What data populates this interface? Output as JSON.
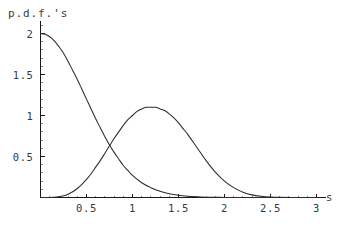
{
  "figure": {
    "width": 344,
    "height": 231,
    "background_color": "#ffffff",
    "title": "p.d.f.'s"
  },
  "style": {
    "curve_color": "#2b2b2b",
    "axis_color": "#1a1a1a",
    "minor_tick_color": "#8a8a8a",
    "text_color": "#3a3a3a"
  },
  "chart_data": {
    "type": "line",
    "title": "p.d.f.'s",
    "xlabel": "s",
    "ylabel": "",
    "xlim": [
      0,
      3.1
    ],
    "ylim": [
      0,
      2.15
    ],
    "grid": false,
    "legend": "none",
    "x_ticks": [
      0.5,
      1,
      1.5,
      2,
      2.5,
      3
    ],
    "x_tick_labels": [
      "0.5",
      "1",
      "1.5",
      "2",
      "2.5",
      "3"
    ],
    "y_ticks": [
      0.5,
      1,
      1.5,
      2
    ],
    "y_tick_labels": [
      "0.5",
      "1",
      "1.5",
      "2"
    ],
    "x_minor_tick_step": 0.1,
    "y_minor_tick_step": 0.1,
    "annotations": [
      "curves cross at approximately s = 0.74, pdf = 0.38"
    ],
    "series": [
      {
        "name": "decaying p.d.f.",
        "description": "monotonically decreasing density starting at 2.0",
        "x": [
          0.0,
          0.05,
          0.1,
          0.15,
          0.2,
          0.25,
          0.3,
          0.35,
          0.4,
          0.45,
          0.5,
          0.55,
          0.6,
          0.65,
          0.7,
          0.75,
          0.8,
          0.85,
          0.9,
          0.95,
          1.0,
          1.1,
          1.2,
          1.3,
          1.4,
          1.5,
          1.6,
          1.7,
          1.8,
          1.9,
          2.0,
          2.1,
          2.2,
          2.3,
          2.4,
          2.5,
          2.6,
          2.8,
          3.0
        ],
        "y": [
          2.0,
          1.99,
          1.96,
          1.91,
          1.84,
          1.76,
          1.66,
          1.55,
          1.44,
          1.32,
          1.2,
          1.08,
          0.96,
          0.85,
          0.74,
          0.64,
          0.55,
          0.47,
          0.39,
          0.33,
          0.27,
          0.18,
          0.12,
          0.075,
          0.046,
          0.027,
          0.015,
          0.008,
          0.004,
          0.002,
          0.001,
          0.0006,
          0.0003,
          0.0001,
          0.0001,
          5e-05,
          2e-05,
          1e-05,
          0.0
        ]
      },
      {
        "name": "bell-shaped p.d.f.",
        "description": "unimodal density peaking near s = 1.25",
        "peak_x": 1.25,
        "peak_y": 1.1,
        "x": [
          0.0,
          0.1,
          0.2,
          0.25,
          0.3,
          0.35,
          0.4,
          0.45,
          0.5,
          0.55,
          0.6,
          0.65,
          0.7,
          0.75,
          0.8,
          0.85,
          0.9,
          0.95,
          1.0,
          1.05,
          1.1,
          1.15,
          1.2,
          1.25,
          1.3,
          1.35,
          1.4,
          1.45,
          1.5,
          1.55,
          1.6,
          1.7,
          1.8,
          1.9,
          2.0,
          2.1,
          2.2,
          2.3,
          2.4,
          2.5,
          2.6,
          2.8,
          3.0
        ],
        "y": [
          0.0,
          0.0,
          0.01,
          0.02,
          0.04,
          0.07,
          0.11,
          0.16,
          0.22,
          0.29,
          0.37,
          0.45,
          0.54,
          0.63,
          0.72,
          0.8,
          0.88,
          0.95,
          1.0,
          1.05,
          1.08,
          1.1,
          1.1,
          1.1,
          1.08,
          1.06,
          1.02,
          0.97,
          0.91,
          0.84,
          0.77,
          0.61,
          0.45,
          0.31,
          0.2,
          0.12,
          0.065,
          0.032,
          0.015,
          0.006,
          0.002,
          0.0,
          0.0
        ]
      }
    ]
  }
}
